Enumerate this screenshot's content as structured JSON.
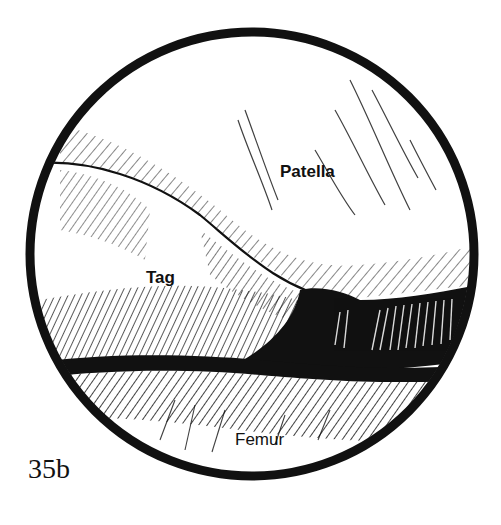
{
  "figure": {
    "number": "35b",
    "view": "arthroscopic circular view",
    "colors": {
      "ink": "#111111",
      "paper": "#ffffff"
    },
    "labels": {
      "patella": "Patella",
      "tag": "Tag",
      "femur": "Femur"
    }
  }
}
